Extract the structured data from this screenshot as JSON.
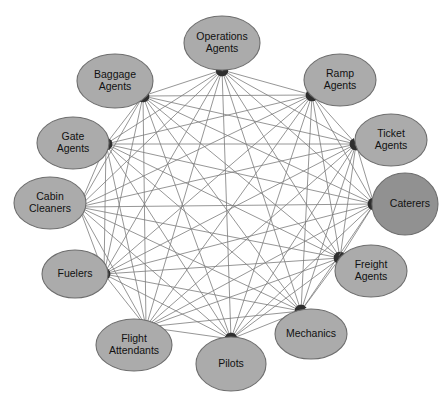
{
  "diagram": {
    "type": "network-graph",
    "title": "",
    "background_color": "#ffffff",
    "node_fill": "#ababab",
    "node_stroke": "#6e6e6e",
    "node_dark_fill": "#919191",
    "edge_color": "#7b7b7b",
    "label_color": "#111111",
    "edge_style": "complete-graph-bidirectional",
    "node_count": 12,
    "edge_count": 66
  },
  "nodes": [
    {
      "id": "operations-agents",
      "label_lines": [
        "Operations",
        "Agents"
      ],
      "label": "Operations Agents",
      "cx": 222,
      "cy": 43,
      "rx": 38,
      "ry": 27,
      "shape": "ellipse",
      "fill": "#ababab",
      "anchor_x": 222,
      "anchor_y": 70,
      "label_dx": 0,
      "label_dy": 0,
      "clipped": false
    },
    {
      "id": "ramp-agents",
      "label_lines": [
        "Ramp",
        "Agents"
      ],
      "label": "Ramp Agents",
      "cx": 340,
      "cy": 80,
      "rx": 36,
      "ry": 26,
      "shape": "ellipse",
      "fill": "#ababab",
      "anchor_x": 312,
      "anchor_y": 95,
      "label_dx": 0,
      "label_dy": 0,
      "clipped": false
    },
    {
      "id": "ticket-agents",
      "label_lines": [
        "Ticket",
        "Agents"
      ],
      "label": "Ticket Agents",
      "cx": 391,
      "cy": 140,
      "rx": 36,
      "ry": 26,
      "shape": "ellipse",
      "fill": "#ababab",
      "anchor_x": 356,
      "anchor_y": 144,
      "label_dx": 0,
      "label_dy": 0,
      "clipped": false
    },
    {
      "id": "caterers",
      "label_lines": [
        "Caterers"
      ],
      "label": "Caterers",
      "cx": 405,
      "cy": 204,
      "rx": 33,
      "ry": 31,
      "shape": "ellipse",
      "fill": "#919191",
      "anchor_x": 374,
      "anchor_y": 204,
      "label_dx": 5,
      "label_dy": 0,
      "clipped": true
    },
    {
      "id": "freight-agents",
      "label_lines": [
        "Freight",
        "Agents"
      ],
      "label": "Freight Agents",
      "cx": 371,
      "cy": 271,
      "rx": 36,
      "ry": 26,
      "shape": "ellipse",
      "fill": "#ababab",
      "anchor_x": 340,
      "anchor_y": 258,
      "label_dx": 0,
      "label_dy": 0,
      "clipped": false
    },
    {
      "id": "mechanics",
      "label_lines": [
        "Mechanics"
      ],
      "label": "Mechanics",
      "cx": 311,
      "cy": 334,
      "rx": 36,
      "ry": 25,
      "shape": "ellipse",
      "fill": "#ababab",
      "anchor_x": 301,
      "anchor_y": 311,
      "label_dx": 0,
      "label_dy": 0,
      "clipped": false
    },
    {
      "id": "pilots",
      "label_lines": [
        "Pilots"
      ],
      "label": "Pilots",
      "cx": 231,
      "cy": 364,
      "rx": 35,
      "ry": 27,
      "shape": "ellipse",
      "fill": "#ababab",
      "anchor_x": 231,
      "anchor_y": 339,
      "label_dx": 0,
      "label_dy": 0,
      "clipped": false
    },
    {
      "id": "flight-attendants",
      "label_lines": [
        "Flight",
        "Attendants"
      ],
      "label": "Flight Attendants",
      "cx": 134,
      "cy": 345,
      "rx": 38,
      "ry": 26,
      "shape": "ellipse",
      "fill": "#ababab",
      "anchor_x": 146,
      "anchor_y": 327,
      "label_dx": 0,
      "label_dy": 0,
      "clipped": false
    },
    {
      "id": "fuelers",
      "label_lines": [
        "Fuelers"
      ],
      "label": "Fuelers",
      "cx": 75,
      "cy": 274,
      "rx": 33,
      "ry": 24,
      "shape": "ellipse",
      "fill": "#ababab",
      "anchor_x": 104,
      "anchor_y": 274,
      "label_dx": 0,
      "label_dy": 0,
      "clipped": false
    },
    {
      "id": "cabin-cleaners",
      "label_lines": [
        "Cabin",
        "Cleaners"
      ],
      "label": "Cabin Cleaners",
      "cx": 50,
      "cy": 203,
      "rx": 36,
      "ry": 26,
      "shape": "ellipse",
      "fill": "#ababab",
      "anchor_x": 79,
      "anchor_y": 207,
      "label_dx": 0,
      "label_dy": 0,
      "clipped": false
    },
    {
      "id": "gate-agents",
      "label_lines": [
        "Gate",
        "Agents"
      ],
      "label": "Gate Agents",
      "cx": 73,
      "cy": 143,
      "rx": 36,
      "ry": 26,
      "shape": "ellipse",
      "fill": "#ababab",
      "anchor_x": 106,
      "anchor_y": 144,
      "label_dx": 0,
      "label_dy": 0,
      "clipped": false
    },
    {
      "id": "baggage-agents",
      "label_lines": [
        "Baggage",
        "Agents"
      ],
      "label": "Baggage Agents",
      "cx": 115,
      "cy": 81,
      "rx": 38,
      "ry": 27,
      "shape": "ellipse",
      "fill": "#ababab",
      "anchor_x": 143,
      "anchor_y": 96,
      "label_dx": 0,
      "label_dy": 0,
      "clipped": false
    }
  ]
}
